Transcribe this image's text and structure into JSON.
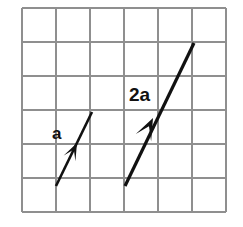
{
  "figure": {
    "background_color": "#ffffff",
    "width": 243,
    "height": 227
  },
  "grid": {
    "name": "square-grid",
    "color": "#8f8f8f",
    "columns": 6,
    "rows": 6,
    "x0": 22,
    "y0": 8,
    "cell_size": 34,
    "stroke_width": 1.1
  },
  "chart_data": {
    "type": "scatter",
    "xlabel": "",
    "ylabel": "",
    "grid": true,
    "legend": "none",
    "xlim": [
      0,
      6
    ],
    "ylim": [
      0,
      6
    ],
    "annotations": [
      {
        "text": "a",
        "x": 1.0,
        "y": 3.45
      },
      {
        "text": "2a",
        "x": 3.2,
        "y": 4.75
      }
    ],
    "series": [
      {
        "name": "a",
        "type": "vector",
        "label": "a",
        "tail": [
          1,
          1
        ],
        "tip": [
          2,
          3.1
        ],
        "components": [
          1,
          2.1
        ],
        "color": "#111111"
      },
      {
        "name": "2a",
        "type": "vector",
        "label": "2a",
        "tail": [
          3,
          1
        ],
        "tip": [
          5,
          5.2
        ],
        "components": [
          2,
          4.2
        ],
        "color": "#111111"
      }
    ]
  },
  "vectors": [
    {
      "id": "vector-a",
      "label": "a",
      "label_position": {
        "x": 52,
        "y": 139
      },
      "label_font_size": 17,
      "tail_px": {
        "x": 56,
        "y": 186
      },
      "tip_px": {
        "x": 92,
        "y": 112
      },
      "arrowhead_px": {
        "x": 77,
        "y": 143
      },
      "stroke_width": 2.6,
      "color": "#111111"
    },
    {
      "id": "vector-2a",
      "label": "2a",
      "label_position": {
        "x": 129,
        "y": 101
      },
      "label_font_size": 19,
      "tail_px": {
        "x": 125,
        "y": 186
      },
      "tip_px": {
        "x": 194,
        "y": 43
      },
      "arrowhead_px": {
        "x": 153,
        "y": 118
      },
      "stroke_width": 3.2,
      "color": "#111111"
    }
  ]
}
